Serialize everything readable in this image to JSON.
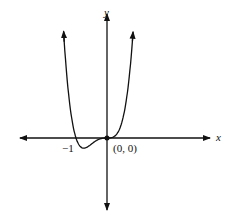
{
  "chart_data": {
    "type": "line",
    "title": "",
    "xlabel": "x",
    "ylabel": "y",
    "function_shape": "quartic with roots at x=-1 and x=0 (triple root at 0), e.g. y = x^3(x+1)",
    "annotations": [
      {
        "text": "-1",
        "x": -1,
        "y": 0
      },
      {
        "text": "(0, 0)",
        "x": 0,
        "y": 0
      }
    ],
    "marked_points": [
      {
        "x": 0,
        "y": 0
      }
    ],
    "x_intercepts": [
      -1,
      0
    ],
    "grid": false,
    "legend": "none"
  },
  "labels": {
    "x_axis": "x",
    "y_axis": "y",
    "neg_one": "−1",
    "origin": "(0, 0)"
  }
}
